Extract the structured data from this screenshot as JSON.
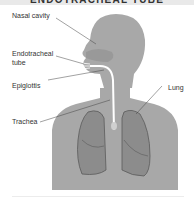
{
  "title": "ENDOTRACHEAL TUBE",
  "labels": {
    "nasal_cavity": "Nasal cavity",
    "endotracheal_tube_line1": "Endotracheal",
    "endotracheal_tube_line2": "tube",
    "epiglottis": "Epiglottis",
    "trachea": "Trachea",
    "lung": "Lung"
  },
  "colors": {
    "body": "#a8a8a8",
    "lung": "#8c8c8c",
    "lung_outline": "#5a5a5a",
    "tube": "#ffffff",
    "leader_line": "#444444",
    "text": "#333333"
  }
}
